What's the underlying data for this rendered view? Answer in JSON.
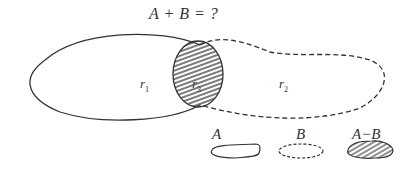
{
  "title": "A + B = ?",
  "regions": {
    "r1": {
      "base": "r",
      "sub": "1"
    },
    "r3": {
      "base": "r",
      "sub": "3"
    },
    "r2": {
      "base": "r",
      "sub": "2"
    }
  },
  "legend": {
    "a": {
      "label": "A",
      "style": "solid outline"
    },
    "b": {
      "label": "B",
      "style": "dashed outline"
    },
    "a_minus_b": {
      "label": "A−B",
      "style": "hatched"
    }
  },
  "colors": {
    "stroke": "#333333",
    "background": "#ffffff"
  }
}
